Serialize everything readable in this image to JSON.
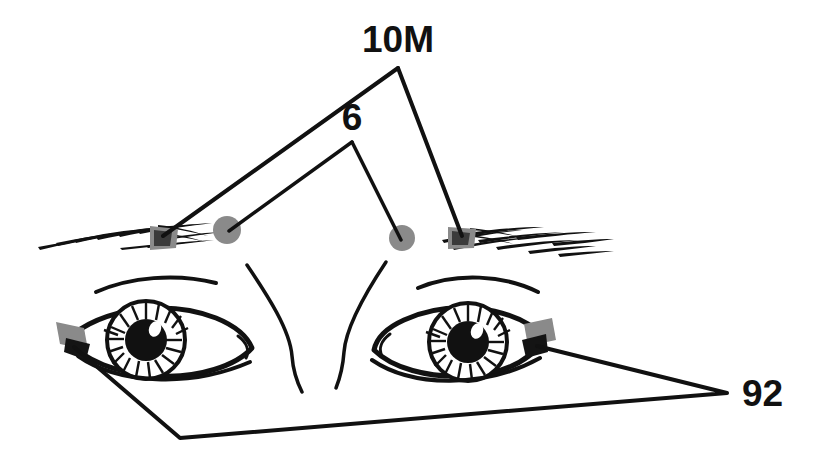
{
  "figure": {
    "width": 828,
    "height": 460,
    "background_color": "#ffffff",
    "ink_color": "#111111",
    "marker_gray": "#8a8a8a",
    "marker_dark": "#141414"
  },
  "labels": {
    "brow_outer": "10M",
    "brow_inner": "6",
    "canthi": "92"
  },
  "leaders": [
    {
      "name": "leader-10m",
      "label": "10M",
      "label_position": {
        "x": 398,
        "y": 52
      },
      "apex": {
        "x": 398,
        "y": 68
      },
      "endpoints": [
        {
          "x": 163,
          "y": 236
        },
        {
          "x": 462,
          "y": 234
        }
      ]
    },
    {
      "name": "leader-6",
      "label": "6",
      "label_position": {
        "x": 352,
        "y": 128
      },
      "apex": {
        "x": 352,
        "y": 142
      },
      "endpoints": [
        {
          "x": 227,
          "y": 230
        },
        {
          "x": 402,
          "y": 238
        }
      ]
    },
    {
      "name": "leader-92",
      "label": "92",
      "label_position": {
        "x": 744,
        "y": 400
      },
      "vertex_right": {
        "x": 727,
        "y": 393
      },
      "vertex_bottom": {
        "x": 180,
        "y": 438
      },
      "endpoints": [
        {
          "x": 74,
          "y": 345
        },
        {
          "x": 537,
          "y": 346
        }
      ]
    }
  ],
  "markers": [
    {
      "name": "electrode-brow-left-outer",
      "type": "brow-blob",
      "x": 163,
      "y": 237,
      "label_ref": "10M"
    },
    {
      "name": "electrode-brow-right-outer",
      "type": "brow-blob",
      "x": 462,
      "y": 236,
      "label_ref": "10M"
    },
    {
      "name": "electrode-brow-left-inner",
      "type": "dot",
      "x": 227,
      "y": 230,
      "r": 14,
      "label_ref": "6"
    },
    {
      "name": "electrode-brow-right-inner",
      "type": "dot",
      "x": 402,
      "y": 238,
      "r": 13,
      "label_ref": "6"
    },
    {
      "name": "electrode-canthus-left",
      "type": "patch",
      "x": 74,
      "y": 345,
      "label_ref": "92"
    },
    {
      "name": "electrode-canthus-right",
      "type": "patch",
      "x": 537,
      "y": 346,
      "label_ref": "92"
    }
  ],
  "anatomy": {
    "eyebrow_left": "hatched hair strokes sloping up to the right",
    "eyebrow_right": "hatched hair strokes sloping down to the right",
    "eye_left": "almond outline with striated iris, black pupil, white highlight",
    "eye_right": "almond outline with striated iris, black pupil, white highlight",
    "lid_crease_left": "thin arc above left eye",
    "lid_crease_right": "thin arc above right eye",
    "nose_bridge": "two curved glabella lines descending between the eyes"
  }
}
